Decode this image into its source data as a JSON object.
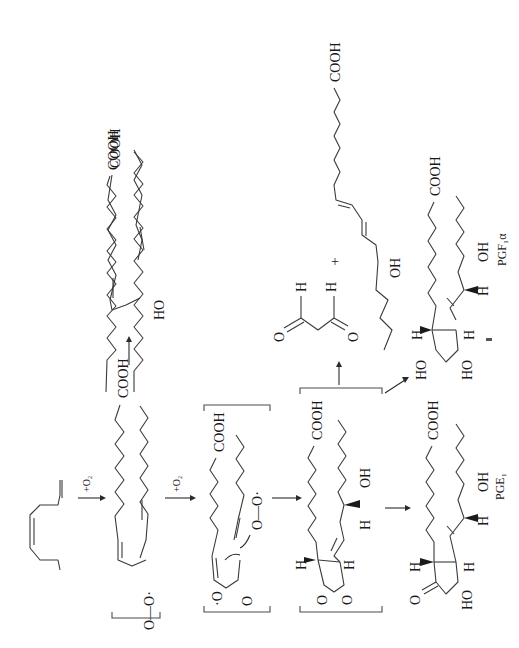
{
  "diagram": {
    "orientation": "rotated 90 degrees clockwise",
    "colors": {
      "ink": "#1a1a1a",
      "bond": "#3a3a3a",
      "background": "#ffffff"
    },
    "reagents": {
      "step1": "+O₂",
      "step2": "+O₂"
    },
    "molecules": {
      "substrate": {
        "group": "COOH"
      },
      "hydroperoxyl_radical": {
        "group": "COOH",
        "peroxy": "O—O·"
      },
      "hydroxy_acid": {
        "group": "COOH",
        "hydroxyl": "HO"
      },
      "endoperoxide_radical": {
        "group": "COOH",
        "peroxy": "O—O·",
        "ring_o1": "·O",
        "ring_o2": "O"
      },
      "endoperoxide": {
        "group": "COOH",
        "hydroxyl": "OH",
        "h1": "H",
        "h2": "H",
        "h3": "H",
        "ring_o1": "O",
        "ring_o2": "O"
      },
      "malondialdehyde": {
        "h1": "H",
        "h2": "H",
        "o1": "O",
        "o2": "O"
      },
      "plus": "+",
      "hydroxy_triene": {
        "group": "COOH",
        "hydroxyl": "OH"
      },
      "pge1": {
        "name": "PGE₁",
        "group": "COOH",
        "ketone": "O",
        "hydroxyl_ring": "HO",
        "hydroxyl_chain": "OH",
        "h1": "H",
        "h2": "H",
        "h3": "H"
      },
      "pgf1a": {
        "name": "PGF₁α",
        "group": "COOH",
        "hydroxyl_ring1": "HO",
        "hydroxyl_ring2": "HO",
        "hydroxyl_chain": "OH",
        "h1": "H",
        "h2": "H",
        "h3": "H"
      }
    }
  }
}
